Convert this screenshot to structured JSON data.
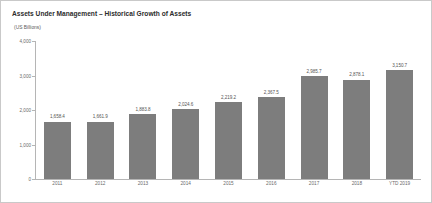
{
  "chart": {
    "title": "Assets Under Management – Historical Growth of Assets",
    "subtitle": "(US Billions)"
  },
  "chart_data": {
    "type": "bar",
    "title": "Assets Under Management – Historical Growth of Assets",
    "subtitle": "(US Billions)",
    "xlabel": "",
    "ylabel": "(US Billions)",
    "ylim": [
      0,
      4000
    ],
    "ytick_labels": [
      "4,000",
      "3,000",
      "2,000",
      "1,000",
      "0"
    ],
    "ytick_values": [
      4000,
      3000,
      2000,
      1000,
      0
    ],
    "grid": false,
    "legend": false,
    "bar_color": "#7d7d7d",
    "categories": [
      "2011",
      "2012",
      "2013",
      "2014",
      "2015",
      "2016",
      "2017",
      "2018",
      "YTD 2019"
    ],
    "values": [
      1658.4,
      1661.9,
      1883.8,
      2024.6,
      2219.2,
      2367.5,
      2985.7,
      2878.1,
      3150.7
    ],
    "value_labels": [
      "1,658.4",
      "1,661.9",
      "1,883.8",
      "2,024.6",
      "2,219.2",
      "2,367.5",
      "2,985.7",
      "2,878.1",
      "3,150.7"
    ]
  }
}
